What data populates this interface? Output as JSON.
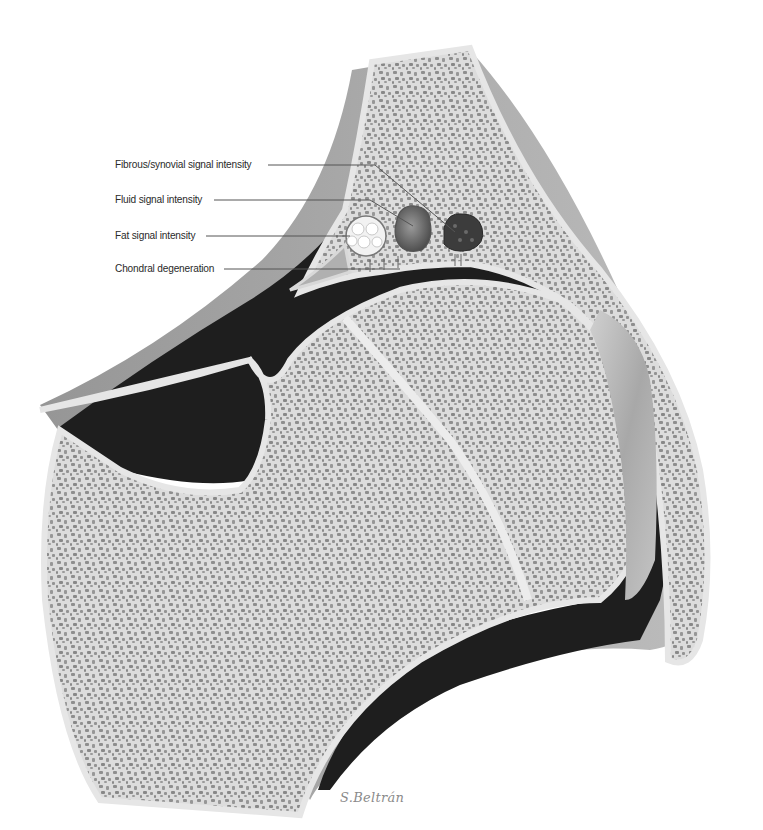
{
  "figure": {
    "labels": [
      {
        "text": "Fibrous/synovial signal intensity",
        "x": 115,
        "y": 159,
        "line_end_x": 265,
        "pointer_to": [
          455,
          232
        ]
      },
      {
        "text": "Fluid signal intensity",
        "x": 115,
        "y": 194,
        "line_end_x": 212,
        "pointer_to": [
          415,
          225
        ]
      },
      {
        "text": "Fat signal intensity",
        "x": 115,
        "y": 231,
        "line_end_x": 205,
        "pointer_to": [
          355,
          236
        ]
      },
      {
        "text": "Chondral degeneration",
        "x": 115,
        "y": 263,
        "line_end_x": 222,
        "pointer_to": [
          400,
          266
        ]
      }
    ],
    "lesions": [
      {
        "name": "fat-lesion",
        "type": "fat",
        "cx": 366,
        "cy": 236,
        "fill": "#f2f2f2"
      },
      {
        "name": "fluid-lesion",
        "type": "fluid",
        "cx": 413,
        "cy": 228,
        "fill": "#6e6e6e"
      },
      {
        "name": "fibrous-lesion",
        "type": "fibrous",
        "cx": 461,
        "cy": 232,
        "fill": "#3c3c3c"
      }
    ],
    "colors": {
      "background": "#ffffff",
      "bone_matrix": "#d9d9d9",
      "bone_pores": "#8c8c8c",
      "cortex": "#e8e8e8",
      "joint_space": "#1e1e1e",
      "capsule": "#9a9a9a",
      "label_text": "#2a2a2a",
      "leader_line": "#555555"
    },
    "signature": "S.Beltrán"
  }
}
